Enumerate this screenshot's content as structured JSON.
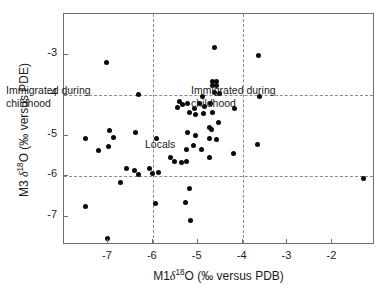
{
  "chart_data": {
    "type": "scatter",
    "title": "",
    "xlabel": "M1δ¹⁸O (‰ versus PDB)",
    "ylabel": "M3 δ¹⁸O (‰ versus PDE)",
    "xlabel_parts": {
      "pre": "M1",
      "sym": "δ",
      "sup": "18",
      "post": "O (‰ versus PDB)"
    },
    "ylabel_parts": {
      "pre": "M3 ",
      "sym": "δ",
      "sup": "18",
      "post": "O (‰ versus PDE)"
    },
    "xlim": [
      -7.98,
      -1.05
    ],
    "ylim": [
      -7.7,
      -2.0
    ],
    "xticks": [
      -7,
      -6,
      -5,
      -4,
      -3,
      -2
    ],
    "xticklabels": [
      "-7",
      "-6",
      "-5",
      "-4",
      "-3",
      "-2"
    ],
    "yticks": [
      -3,
      -4,
      -5,
      -6,
      -7
    ],
    "yticklabels": [
      "-3",
      "-4",
      "-5",
      "-6",
      "-7"
    ],
    "grid": false,
    "legend": null,
    "reference_lines": {
      "vertical": [
        -6.0,
        -4.0
      ],
      "horizontal": [
        -4.0,
        -6.0
      ],
      "style": "dashed"
    },
    "annotations": [
      {
        "text": "Immigrated during\nchildhood",
        "x": -7.85,
        "y": -4.35,
        "name": "annotation-left"
      },
      {
        "text": "Immigrated during\nchildhood",
        "x": -3.72,
        "y": -4.35,
        "name": "annotation-right"
      },
      {
        "text": "Locals",
        "x": -4.62,
        "y": -5.7,
        "name": "annotation-locals"
      }
    ],
    "series": [
      {
        "name": "individuals",
        "marker": "filled-circle",
        "color": "#0a0a0a",
        "points": [
          [
            -7.03,
            -3.2
          ],
          [
            -6.32,
            -3.99
          ],
          [
            -4.63,
            -2.83
          ],
          [
            -3.64,
            -3.02
          ],
          [
            -4.66,
            -3.77
          ],
          [
            -4.58,
            -3.77
          ],
          [
            -4.66,
            -3.66
          ],
          [
            -4.58,
            -3.66
          ],
          [
            -4.62,
            -3.93
          ],
          [
            -4.52,
            -3.97
          ],
          [
            -4.9,
            -4.04
          ],
          [
            -5.4,
            -4.17
          ],
          [
            -5.33,
            -4.24
          ],
          [
            -5.45,
            -4.3
          ],
          [
            -5.22,
            -4.22
          ],
          [
            -5.08,
            -4.32
          ],
          [
            -4.96,
            -4.21
          ],
          [
            -4.86,
            -4.28
          ],
          [
            -4.72,
            -4.2
          ],
          [
            -4.66,
            -4.44
          ],
          [
            -5.19,
            -4.42
          ],
          [
            -5.06,
            -4.47
          ],
          [
            -4.88,
            -4.46
          ],
          [
            -3.63,
            -4.04
          ],
          [
            -4.18,
            -4.33
          ],
          [
            -4.54,
            -4.68
          ],
          [
            -7.5,
            -5.08
          ],
          [
            -6.97,
            -4.88
          ],
          [
            -6.88,
            -5.05
          ],
          [
            -6.99,
            -5.28
          ],
          [
            -6.38,
            -4.93
          ],
          [
            -7.22,
            -5.37
          ],
          [
            -5.92,
            -5.08
          ],
          [
            -5.22,
            -4.92
          ],
          [
            -5.06,
            -5.0
          ],
          [
            -4.74,
            -4.81
          ],
          [
            -4.7,
            -4.86
          ],
          [
            -4.74,
            -5.08
          ],
          [
            -4.58,
            -5.09
          ],
          [
            -3.66,
            -5.21
          ],
          [
            -4.2,
            -5.44
          ],
          [
            -5.09,
            -5.25
          ],
          [
            -4.92,
            -5.34
          ],
          [
            -5.25,
            -5.35
          ],
          [
            -4.74,
            -5.54
          ],
          [
            -5.61,
            -5.55
          ],
          [
            -5.52,
            -5.63
          ],
          [
            -5.36,
            -5.67
          ],
          [
            -5.26,
            -5.65
          ],
          [
            -6.59,
            -5.8
          ],
          [
            -6.4,
            -5.86
          ],
          [
            -6.32,
            -5.96
          ],
          [
            -6.08,
            -5.81
          ],
          [
            -6.0,
            -5.93
          ],
          [
            -5.88,
            -5.9
          ],
          [
            -1.3,
            -6.05
          ],
          [
            -6.71,
            -6.16
          ],
          [
            -5.18,
            -6.31
          ],
          [
            -7.5,
            -6.75
          ],
          [
            -5.95,
            -6.68
          ],
          [
            -5.28,
            -6.64
          ],
          [
            -5.17,
            -7.09
          ],
          [
            -7.02,
            -7.54
          ]
        ]
      }
    ]
  }
}
